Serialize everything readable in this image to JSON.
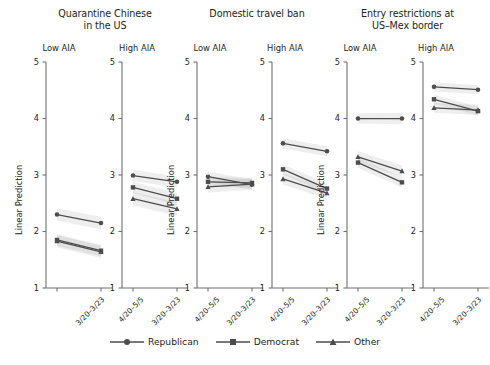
{
  "figure": {
    "ylabel": "Linear Prediction",
    "y_ticks": [
      "5",
      "4",
      "3",
      "2",
      "1"
    ],
    "x_ticks": [
      "3/20–3/23",
      "4/20–5/5"
    ],
    "subpanel_low": "Low AIA",
    "subpanel_high": "High AIA"
  },
  "legend": {
    "items": [
      {
        "label": "Republican",
        "marker": "circle"
      },
      {
        "label": "Democrat",
        "marker": "square"
      },
      {
        "label": "Other",
        "marker": "triangle"
      }
    ]
  },
  "groups": [
    {
      "title_line1": "Quarantine Chinese",
      "title_line2": "in the US"
    },
    {
      "title_line1": "Domestic travel ban",
      "title_line2": ""
    },
    {
      "title_line1": "Entry restrictions at",
      "title_line2": "US–Mex border"
    }
  ],
  "chart_data": {
    "type": "line",
    "xlabel": "",
    "ylabel": "Linear Prediction",
    "x": [
      "3/20–3/23",
      "4/20–5/5"
    ],
    "ylim": [
      1,
      5
    ],
    "yticks": [
      1,
      2,
      3,
      4,
      5
    ],
    "grid": false,
    "legend_position": "bottom",
    "facet_rows": [
      "Quarantine Chinese in the US",
      "Domestic travel ban",
      "Entry restrictions at US–Mex border"
    ],
    "facet_cols": [
      "Low AIA",
      "High AIA"
    ],
    "panels": [
      {
        "group": "Quarantine Chinese in the US",
        "aia": "Low AIA",
        "series": [
          {
            "name": "Republican",
            "marker": "circle",
            "values": [
              2.3,
              2.15
            ],
            "ci_lower": [
              2.19,
              2.04
            ],
            "ci_upper": [
              2.41,
              2.26
            ]
          },
          {
            "name": "Democrat",
            "marker": "square",
            "values": [
              1.85,
              1.66
            ],
            "ci_lower": [
              1.75,
              1.56
            ],
            "ci_upper": [
              1.95,
              1.76
            ]
          },
          {
            "name": "Other",
            "marker": "triangle",
            "values": [
              1.83,
              1.64
            ],
            "ci_lower": [
              1.72,
              1.53
            ],
            "ci_upper": [
              1.94,
              1.75
            ]
          }
        ]
      },
      {
        "group": "Quarantine Chinese in the US",
        "aia": "High AIA",
        "series": [
          {
            "name": "Republican",
            "marker": "circle",
            "values": [
              2.99,
              2.88
            ],
            "ci_lower": [
              2.89,
              2.78
            ],
            "ci_upper": [
              3.09,
              2.98
            ]
          },
          {
            "name": "Democrat",
            "marker": "square",
            "values": [
              2.78,
              2.58
            ],
            "ci_lower": [
              2.68,
              2.48
            ],
            "ci_upper": [
              2.88,
              2.68
            ]
          },
          {
            "name": "Other",
            "marker": "triangle",
            "values": [
              2.58,
              2.4
            ],
            "ci_lower": [
              2.46,
              2.28
            ],
            "ci_upper": [
              2.7,
              2.52
            ]
          }
        ]
      },
      {
        "group": "Domestic travel ban",
        "aia": "Low AIA",
        "series": [
          {
            "name": "Republican",
            "marker": "circle",
            "values": [
              2.97,
              2.83
            ],
            "ci_lower": [
              2.88,
              2.74
            ],
            "ci_upper": [
              3.06,
              2.92
            ]
          },
          {
            "name": "Democrat",
            "marker": "square",
            "values": [
              2.88,
              2.86
            ],
            "ci_lower": [
              2.79,
              2.77
            ],
            "ci_upper": [
              2.97,
              2.95
            ]
          },
          {
            "name": "Other",
            "marker": "triangle",
            "values": [
              2.79,
              2.84
            ],
            "ci_lower": [
              2.69,
              2.74
            ],
            "ci_upper": [
              2.89,
              2.94
            ]
          }
        ]
      },
      {
        "group": "Domestic travel ban",
        "aia": "High AIA",
        "series": [
          {
            "name": "Republican",
            "marker": "circle",
            "values": [
              3.56,
              3.42
            ],
            "ci_lower": [
              3.47,
              3.33
            ],
            "ci_upper": [
              3.65,
              3.51
            ]
          },
          {
            "name": "Democrat",
            "marker": "square",
            "values": [
              3.1,
              2.76
            ],
            "ci_lower": [
              3.01,
              2.67
            ],
            "ci_upper": [
              3.19,
              2.85
            ]
          },
          {
            "name": "Other",
            "marker": "triangle",
            "values": [
              2.93,
              2.68
            ],
            "ci_lower": [
              2.83,
              2.58
            ],
            "ci_upper": [
              3.03,
              2.78
            ]
          }
        ]
      },
      {
        "group": "Entry restrictions at US–Mex border",
        "aia": "Low AIA",
        "series": [
          {
            "name": "Republican",
            "marker": "circle",
            "values": [
              4.0,
              4.0
            ],
            "ci_lower": [
              3.91,
              3.9
            ],
            "ci_upper": [
              4.09,
              4.1
            ]
          },
          {
            "name": "Democrat",
            "marker": "square",
            "values": [
              3.22,
              2.87
            ],
            "ci_lower": [
              3.13,
              2.78
            ],
            "ci_upper": [
              3.31,
              2.96
            ]
          },
          {
            "name": "Other",
            "marker": "triangle",
            "values": [
              3.32,
              3.07
            ],
            "ci_lower": [
              3.22,
              2.97
            ],
            "ci_upper": [
              3.42,
              3.17
            ]
          }
        ]
      },
      {
        "group": "Entry restrictions at US–Mex border",
        "aia": "High AIA",
        "series": [
          {
            "name": "Republican",
            "marker": "circle",
            "values": [
              4.56,
              4.51
            ],
            "ci_lower": [
              4.48,
              4.43
            ],
            "ci_upper": [
              4.64,
              4.59
            ]
          },
          {
            "name": "Democrat",
            "marker": "square",
            "values": [
              4.34,
              4.13
            ],
            "ci_lower": [
              4.26,
              4.05
            ],
            "ci_upper": [
              4.42,
              4.21
            ]
          },
          {
            "name": "Other",
            "marker": "triangle",
            "values": [
              4.19,
              4.15
            ],
            "ci_lower": [
              4.1,
              4.06
            ],
            "ci_upper": [
              4.28,
              4.24
            ]
          }
        ]
      }
    ]
  }
}
